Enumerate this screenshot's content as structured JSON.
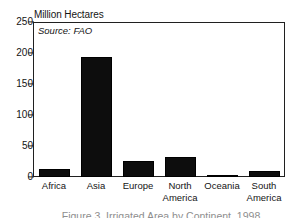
{
  "chart_data": {
    "type": "bar",
    "title": "Million Hectares",
    "xlabel": "",
    "ylabel": "Million Hectares",
    "categories": [
      "Africa",
      "Asia",
      "Europe",
      "North America",
      "Oceania",
      "South America"
    ],
    "values": [
      13,
      193,
      26,
      32,
      3,
      10
    ],
    "ylim": [
      0,
      250
    ],
    "yticks": [
      0,
      50,
      100,
      150,
      200,
      250
    ],
    "ytick_labels": [
      "0",
      "50",
      "100",
      "150",
      "200",
      "250"
    ],
    "grid": false,
    "legend": "none",
    "bar_color": "#0d0d0d",
    "annotations": [
      {
        "name": "source",
        "text": "Source: FAO",
        "style": "italic"
      }
    ],
    "series": [
      {
        "name": "Area",
        "values": [
          13,
          193,
          26,
          32,
          3,
          10
        ]
      }
    ]
  },
  "figure": {
    "axis_title": "Million Hectares",
    "source_note": "Source: FAO",
    "category_labels": [
      "Africa",
      "Asia",
      "Europe",
      "North\nAmerica",
      "Oceania",
      "South\nAmerica"
    ],
    "caption_cut": "Figure 3. Irrigated Area by Continent, 1998"
  }
}
